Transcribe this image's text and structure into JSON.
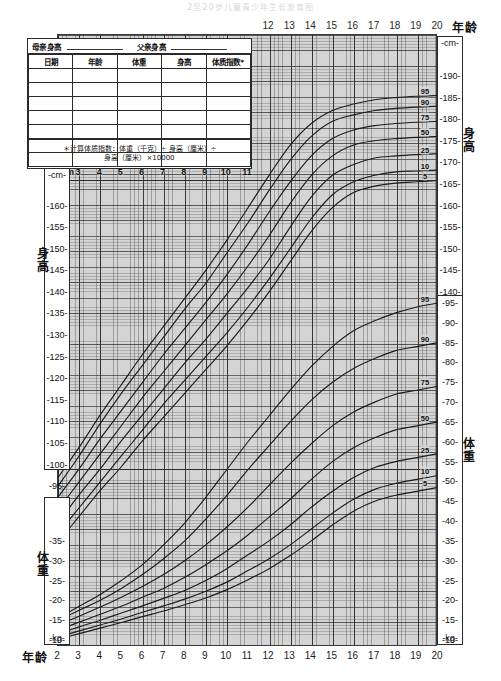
{
  "title": "2至20岁儿童青少年生长发育图",
  "chart_data": {
    "type": "line",
    "title": "2至20岁儿童青少年生长发育图",
    "xlabel": "年龄",
    "ylabel": "身高 / 体重",
    "xlim": [
      2,
      20
    ],
    "grid": true,
    "axes": {
      "x_ticks_bottom": [
        "2",
        "3",
        "4",
        "5",
        "6",
        "7",
        "8",
        "9",
        "10",
        "11",
        "12",
        "13",
        "14",
        "15",
        "16",
        "17",
        "18",
        "19",
        "20"
      ],
      "x_ticks_top": [
        "12",
        "13",
        "14",
        "15",
        "16",
        "17",
        "18",
        "19",
        "20"
      ],
      "x_ticks_inner": [
        "3",
        "4",
        "5",
        "6",
        "7",
        "8",
        "9",
        "10",
        "11"
      ],
      "stature_left_ticks": [
        "160",
        "155",
        "150",
        "145",
        "140",
        "135",
        "130",
        "125",
        "120",
        "115",
        "110",
        "105",
        "100",
        "95",
        "90",
        "85",
        "80"
      ],
      "stature_right_ticks": [
        "190",
        "185",
        "180",
        "175",
        "170",
        "165",
        "160",
        "155",
        "150",
        "145",
        "140",
        "135",
        "130",
        "125",
        "120",
        "115",
        "110",
        "105"
      ],
      "weight_left_ticks": [
        "35",
        "30",
        "25",
        "20",
        "15",
        "10"
      ],
      "weight_right_ticks": [
        "95",
        "90",
        "85",
        "80",
        "75",
        "70",
        "65",
        "60",
        "55",
        "50",
        "45",
        "40",
        "35",
        "30",
        "25",
        "20",
        "15",
        "10"
      ],
      "unit_cm": "cm",
      "unit_kg": "kg"
    },
    "percentile_labels": [
      "95",
      "90",
      "75",
      "50",
      "25",
      "10",
      "5"
    ],
    "stature_percentiles": [
      {
        "name": "95",
        "x": [
          2,
          3,
          4,
          5,
          6,
          7,
          8,
          9,
          10,
          11,
          12,
          13,
          14,
          15,
          16,
          17,
          18,
          19,
          20
        ],
        "values": [
          97.0,
          104.0,
          111.5,
          118.5,
          125.5,
          132.0,
          138.5,
          145.0,
          152.0,
          159.5,
          167.0,
          174.0,
          179.0,
          182.0,
          183.5,
          184.5,
          185.0,
          185.3,
          185.5
        ]
      },
      {
        "name": "90",
        "x": [
          2,
          3,
          4,
          5,
          6,
          7,
          8,
          9,
          10,
          11,
          12,
          13,
          14,
          15,
          16,
          17,
          18,
          19,
          20
        ],
        "values": [
          95.0,
          102.0,
          109.5,
          116.5,
          123.0,
          129.5,
          136.0,
          142.0,
          149.0,
          156.0,
          163.5,
          170.5,
          176.0,
          179.5,
          181.0,
          182.0,
          182.5,
          182.8,
          183.0
        ]
      },
      {
        "name": "75",
        "x": [
          2,
          3,
          4,
          5,
          6,
          7,
          8,
          9,
          10,
          11,
          12,
          13,
          14,
          15,
          16,
          17,
          18,
          19,
          20
        ],
        "values": [
          92.5,
          99.0,
          106.0,
          112.5,
          119.0,
          125.5,
          131.5,
          137.5,
          144.0,
          151.0,
          158.5,
          165.5,
          171.5,
          175.5,
          177.5,
          178.5,
          179.0,
          179.3,
          179.5
        ]
      },
      {
        "name": "50",
        "x": [
          2,
          3,
          4,
          5,
          6,
          7,
          8,
          9,
          10,
          11,
          12,
          13,
          14,
          15,
          16,
          17,
          18,
          19,
          20
        ],
        "values": [
          89.5,
          96.0,
          102.5,
          109.0,
          115.5,
          121.5,
          127.5,
          133.5,
          139.5,
          146.0,
          153.0,
          160.5,
          167.0,
          171.5,
          174.0,
          175.0,
          175.5,
          175.8,
          176.0
        ]
      },
      {
        "name": "25",
        "x": [
          2,
          3,
          4,
          5,
          6,
          7,
          8,
          9,
          10,
          11,
          12,
          13,
          14,
          15,
          16,
          17,
          18,
          19,
          20
        ],
        "values": [
          86.5,
          93.0,
          99.0,
          105.5,
          111.5,
          117.5,
          123.5,
          129.0,
          135.0,
          141.0,
          147.5,
          155.0,
          162.0,
          167.0,
          169.5,
          171.0,
          171.5,
          171.8,
          172.0
        ]
      },
      {
        "name": "10",
        "x": [
          2,
          3,
          4,
          5,
          6,
          7,
          8,
          9,
          10,
          11,
          12,
          13,
          14,
          15,
          16,
          17,
          18,
          19,
          20
        ],
        "values": [
          84.0,
          90.0,
          96.0,
          102.0,
          108.0,
          114.0,
          119.5,
          125.0,
          130.5,
          136.5,
          143.0,
          150.0,
          157.0,
          162.5,
          165.5,
          167.0,
          167.8,
          168.0,
          168.2
        ]
      },
      {
        "name": "5",
        "x": [
          2,
          3,
          4,
          5,
          6,
          7,
          8,
          9,
          10,
          11,
          12,
          13,
          14,
          15,
          16,
          17,
          18,
          19,
          20
        ],
        "values": [
          82.0,
          88.0,
          94.0,
          99.5,
          105.5,
          111.0,
          116.5,
          122.0,
          127.5,
          133.5,
          140.0,
          147.0,
          154.0,
          159.5,
          163.0,
          164.5,
          165.2,
          165.5,
          165.8
        ]
      }
    ],
    "weight_percentiles": [
      {
        "name": "95",
        "x": [
          2,
          3,
          4,
          5,
          6,
          7,
          8,
          9,
          10,
          11,
          12,
          13,
          14,
          15,
          16,
          17,
          18,
          19,
          20
        ],
        "values": [
          15.5,
          18.5,
          21.5,
          25.0,
          29.0,
          34.0,
          39.5,
          46.0,
          53.0,
          60.0,
          66.5,
          73.0,
          79.0,
          84.0,
          88.0,
          90.5,
          92.5,
          94.0,
          95.0
        ]
      },
      {
        "name": "90",
        "x": [
          2,
          3,
          4,
          5,
          6,
          7,
          8,
          9,
          10,
          11,
          12,
          13,
          14,
          15,
          16,
          17,
          18,
          19,
          20
        ],
        "values": [
          14.8,
          17.5,
          20.0,
          23.0,
          26.5,
          30.5,
          35.0,
          40.5,
          46.5,
          53.0,
          59.0,
          65.0,
          70.5,
          75.0,
          78.5,
          81.0,
          83.0,
          84.0,
          85.0
        ]
      },
      {
        "name": "75",
        "x": [
          2,
          3,
          4,
          5,
          6,
          7,
          8,
          9,
          10,
          11,
          12,
          13,
          14,
          15,
          16,
          17,
          18,
          19,
          20
        ],
        "values": [
          13.8,
          16.0,
          18.3,
          20.8,
          23.5,
          26.5,
          30.0,
          34.0,
          38.5,
          43.5,
          49.0,
          54.5,
          59.5,
          64.0,
          67.5,
          70.0,
          72.0,
          73.0,
          74.0
        ]
      },
      {
        "name": "50",
        "x": [
          2,
          3,
          4,
          5,
          6,
          7,
          8,
          9,
          10,
          11,
          12,
          13,
          14,
          15,
          16,
          17,
          18,
          19,
          20
        ],
        "values": [
          12.5,
          14.5,
          16.5,
          18.5,
          20.8,
          23.0,
          25.8,
          29.0,
          32.5,
          36.5,
          41.0,
          45.5,
          50.5,
          55.0,
          58.5,
          61.0,
          63.0,
          64.0,
          65.0
        ]
      },
      {
        "name": "25",
        "x": [
          2,
          3,
          4,
          5,
          6,
          7,
          8,
          9,
          10,
          11,
          12,
          13,
          14,
          15,
          16,
          17,
          18,
          19,
          20
        ],
        "values": [
          11.5,
          13.3,
          15.0,
          16.8,
          18.6,
          20.5,
          22.5,
          25.0,
          28.0,
          31.5,
          35.0,
          39.0,
          43.5,
          47.5,
          51.0,
          53.5,
          55.0,
          56.0,
          57.0
        ]
      },
      {
        "name": "10",
        "x": [
          2,
          3,
          4,
          5,
          6,
          7,
          8,
          9,
          10,
          11,
          12,
          13,
          14,
          15,
          16,
          17,
          18,
          19,
          20
        ],
        "values": [
          10.8,
          12.3,
          13.8,
          15.3,
          17.0,
          18.6,
          20.3,
          22.3,
          24.6,
          27.5,
          30.5,
          34.0,
          38.0,
          42.0,
          45.5,
          48.0,
          49.5,
          50.5,
          51.5
        ]
      },
      {
        "name": "5",
        "x": [
          2,
          3,
          4,
          5,
          6,
          7,
          8,
          9,
          10,
          11,
          12,
          13,
          14,
          15,
          16,
          17,
          18,
          19,
          20
        ],
        "values": [
          10.2,
          11.6,
          13.0,
          14.4,
          15.9,
          17.3,
          18.9,
          20.6,
          22.7,
          25.2,
          28.0,
          31.3,
          35.0,
          39.0,
          42.5,
          45.0,
          46.5,
          47.5,
          48.5
        ]
      }
    ]
  },
  "axis_names": {
    "stature_left": "身高",
    "stature_right": "身高",
    "weight_left": "体重",
    "weight_right": "体重",
    "age_top": "年龄",
    "age_bottom": "年龄"
  },
  "entry_table": {
    "mother_label": "母亲身高",
    "father_label": "父亲身高",
    "columns": [
      "日期",
      "年龄",
      "体重",
      "身高",
      "体质指数*"
    ],
    "blank_rows": 7,
    "note_line1": "＊计算体质指数：体重（千克）÷ 身高（厘米）÷",
    "note_line2": "身高（厘米）×10000"
  }
}
